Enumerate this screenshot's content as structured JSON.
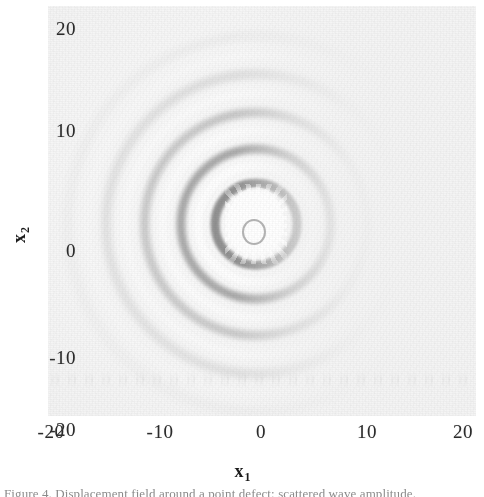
{
  "figure": {
    "caption": "Figure 4. Displacement field around a point defect: scattered wave amplitude.",
    "background_color": "#f4f4f4",
    "ink_color": "#2b2b2b"
  },
  "axes": {
    "x": {
      "title": "x",
      "subscript": "1",
      "ticks": [
        "-20",
        "-10",
        "0",
        "10",
        "20"
      ],
      "range": [
        -20,
        20
      ]
    },
    "y": {
      "title": "x",
      "subscript": "2",
      "ticks": [
        "20",
        "10",
        "0",
        "-10",
        "-20"
      ],
      "range": [
        -20,
        20
      ]
    }
  },
  "chart_data": {
    "type": "heatmap",
    "title": "",
    "subtitle": "",
    "xlabel": "x1",
    "ylabel": "x2",
    "xlim": [
      -20,
      20
    ],
    "ylim": [
      -20,
      20
    ],
    "xticks": [
      -20,
      -10,
      0,
      10,
      20
    ],
    "yticks": [
      -20,
      -10,
      0,
      10,
      20
    ],
    "xticklabels": [
      "-20",
      "-10",
      "0",
      "10",
      "20"
    ],
    "yticklabels": [
      "-20",
      "-10",
      "0",
      "10",
      "20"
    ],
    "grid": false,
    "legend": null,
    "colormap": "grayscale",
    "scatterer": {
      "x1": 1.0,
      "y1": -0.5,
      "peak_value": 1.0
    },
    "wavefronts": [
      {
        "radius": 2.0,
        "phase": "bright",
        "value": 0.95
      },
      {
        "radius": 3.4,
        "phase": "dark",
        "value": -0.72
      },
      {
        "radius": 5.0,
        "phase": "bright",
        "value": 0.66
      },
      {
        "radius": 6.6,
        "phase": "dark",
        "value": -0.55
      },
      {
        "radius": 8.3,
        "phase": "bright",
        "value": 0.44
      },
      {
        "radius": 10.0,
        "phase": "dark",
        "value": -0.35
      },
      {
        "radius": 11.8,
        "phase": "bright",
        "value": 0.27
      },
      {
        "radius": 13.6,
        "phase": "dark",
        "value": -0.2
      },
      {
        "radius": 15.4,
        "phase": "bright",
        "value": 0.14
      },
      {
        "radius": 17.2,
        "phase": "dark",
        "value": -0.09
      }
    ],
    "value_range": [
      -1.0,
      1.0
    ]
  }
}
